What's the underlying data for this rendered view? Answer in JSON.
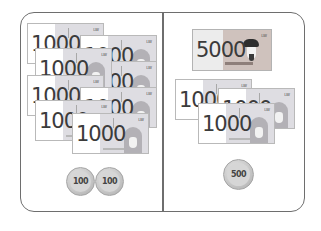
{
  "colors": {
    "frame": "#6e6e6e",
    "note_1000_tint": "#dedde2",
    "note_5000_tint": "#cfc2bd",
    "coin": "#c8c8c8",
    "text": "#3b3b3b"
  },
  "left_panel": {
    "notes": [
      {
        "value": "1000",
        "mark": "LW"
      },
      {
        "value": "1000",
        "mark": "LW"
      },
      {
        "value": "1000",
        "mark": "LW"
      },
      {
        "value": "1000",
        "mark": "LW"
      },
      {
        "value": "1000",
        "mark": "LW"
      },
      {
        "value": "1000",
        "mark": "LW"
      },
      {
        "value": "1000",
        "mark": "LW"
      },
      {
        "value": "1000",
        "mark": "LW"
      }
    ],
    "coins": [
      {
        "value": "100"
      },
      {
        "value": "100"
      }
    ]
  },
  "right_panel": {
    "note_5000": {
      "value": "5000",
      "mark": "LW"
    },
    "notes": [
      {
        "value": "1000",
        "mark": "LW"
      },
      {
        "value": "1000",
        "mark": "LW"
      },
      {
        "value": "1000",
        "mark": "LW"
      }
    ],
    "coins": [
      {
        "value": "500"
      }
    ]
  }
}
